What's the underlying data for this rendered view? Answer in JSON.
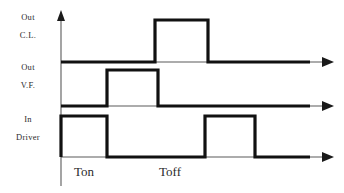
{
  "diagram": {
    "background_color": "#ffffff",
    "trace_color": "#111111",
    "axis_color": "#5a5a5a",
    "label_color": "#2b2b2b",
    "signals": [
      {
        "id": "out-cl",
        "label_line1": "Out",
        "label_line2": "C.L.",
        "baseline_y": 62,
        "high_y": 20,
        "pulses": [
          {
            "start": 155,
            "end": 208
          }
        ]
      },
      {
        "id": "out-vf",
        "label_line1": "Out",
        "label_line2": "V.F.",
        "baseline_y": 106,
        "high_y": 70,
        "pulses": [
          {
            "start": 107,
            "end": 158
          }
        ]
      },
      {
        "id": "in-driver",
        "label_line1": "In",
        "label_line2": "Driver",
        "baseline_y": 157,
        "high_y": 116,
        "pulses": [
          {
            "start": 61,
            "end": 107
          },
          {
            "start": 205,
            "end": 255
          }
        ]
      }
    ],
    "time_axis": {
      "origin_x": 61,
      "end_x": 330,
      "vertical_top_y": 14,
      "vertical_bottom_y": 186
    },
    "time_labels": [
      {
        "text": "Ton",
        "x": 84,
        "y": 176
      },
      {
        "text": "Toff",
        "x": 170,
        "y": 176
      }
    ]
  }
}
